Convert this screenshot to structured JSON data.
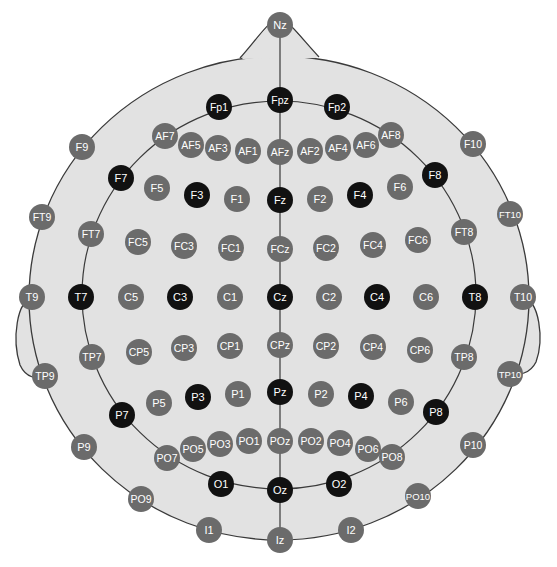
{
  "colors": {
    "background": "#ffffff",
    "head_fill": "#e2e2e2",
    "outline": "#3a3a3a",
    "electrode_standard": "#6b6b6b",
    "electrode_highlight": "#111111",
    "label_text": "#ffffff"
  },
  "legend": {
    "highlight": "10-20 system electrodes (black)",
    "standard": "Additional 10-10 electrodes (gray)"
  },
  "electrodes": [
    {
      "label": "Nz",
      "x": 280,
      "y": 25,
      "type": "standard"
    },
    {
      "label": "Fpz",
      "x": 280,
      "y": 100,
      "type": "highlight"
    },
    {
      "label": "Fp1",
      "x": 219,
      "y": 107,
      "type": "highlight"
    },
    {
      "label": "Fp2",
      "x": 337,
      "y": 107,
      "type": "highlight"
    },
    {
      "label": "AF7",
      "x": 165,
      "y": 136,
      "type": "standard"
    },
    {
      "label": "AF5",
      "x": 191,
      "y": 145,
      "type": "standard"
    },
    {
      "label": "AF3",
      "x": 218,
      "y": 148,
      "type": "standard"
    },
    {
      "label": "AF1",
      "x": 248,
      "y": 151,
      "type": "standard"
    },
    {
      "label": "AFz",
      "x": 280,
      "y": 152,
      "type": "standard"
    },
    {
      "label": "AF2",
      "x": 310,
      "y": 151,
      "type": "standard"
    },
    {
      "label": "AF4",
      "x": 338,
      "y": 148,
      "type": "standard"
    },
    {
      "label": "AF6",
      "x": 366,
      "y": 145,
      "type": "standard"
    },
    {
      "label": "AF8",
      "x": 391,
      "y": 135,
      "type": "standard"
    },
    {
      "label": "F9",
      "x": 82,
      "y": 147,
      "type": "standard"
    },
    {
      "label": "F10",
      "x": 473,
      "y": 144,
      "type": "standard"
    },
    {
      "label": "F7",
      "x": 121,
      "y": 178,
      "type": "highlight"
    },
    {
      "label": "F8",
      "x": 435,
      "y": 175,
      "type": "highlight"
    },
    {
      "label": "F5",
      "x": 157,
      "y": 188,
      "type": "standard"
    },
    {
      "label": "F3",
      "x": 197,
      "y": 195,
      "type": "highlight"
    },
    {
      "label": "F1",
      "x": 237,
      "y": 199,
      "type": "standard"
    },
    {
      "label": "Fz",
      "x": 280,
      "y": 200,
      "type": "highlight"
    },
    {
      "label": "F2",
      "x": 320,
      "y": 199,
      "type": "standard"
    },
    {
      "label": "F4",
      "x": 360,
      "y": 195,
      "type": "highlight"
    },
    {
      "label": "F6",
      "x": 400,
      "y": 187,
      "type": "standard"
    },
    {
      "label": "FT9",
      "x": 42,
      "y": 217,
      "type": "standard"
    },
    {
      "label": "FT10",
      "x": 510,
      "y": 214,
      "type": "standard"
    },
    {
      "label": "FT7",
      "x": 91,
      "y": 234,
      "type": "standard"
    },
    {
      "label": "FT8",
      "x": 464,
      "y": 232,
      "type": "standard"
    },
    {
      "label": "FC5",
      "x": 138,
      "y": 242,
      "type": "standard"
    },
    {
      "label": "FC3",
      "x": 184,
      "y": 246,
      "type": "standard"
    },
    {
      "label": "FC1",
      "x": 231,
      "y": 248,
      "type": "standard"
    },
    {
      "label": "FCz",
      "x": 280,
      "y": 249,
      "type": "standard"
    },
    {
      "label": "FC2",
      "x": 326,
      "y": 248,
      "type": "standard"
    },
    {
      "label": "FC4",
      "x": 373,
      "y": 245,
      "type": "standard"
    },
    {
      "label": "FC6",
      "x": 418,
      "y": 240,
      "type": "standard"
    },
    {
      "label": "T9",
      "x": 32,
      "y": 297,
      "type": "standard"
    },
    {
      "label": "T7",
      "x": 81,
      "y": 297,
      "type": "highlight"
    },
    {
      "label": "C5",
      "x": 131,
      "y": 297,
      "type": "standard"
    },
    {
      "label": "C3",
      "x": 180,
      "y": 297,
      "type": "highlight"
    },
    {
      "label": "C1",
      "x": 230,
      "y": 297,
      "type": "standard"
    },
    {
      "label": "Cz",
      "x": 280,
      "y": 297,
      "type": "highlight"
    },
    {
      "label": "C2",
      "x": 329,
      "y": 297,
      "type": "standard"
    },
    {
      "label": "C4",
      "x": 377,
      "y": 297,
      "type": "highlight"
    },
    {
      "label": "C6",
      "x": 426,
      "y": 297,
      "type": "standard"
    },
    {
      "label": "T8",
      "x": 475,
      "y": 297,
      "type": "highlight"
    },
    {
      "label": "T10",
      "x": 523,
      "y": 297,
      "type": "standard"
    },
    {
      "label": "TP9",
      "x": 45,
      "y": 376,
      "type": "standard"
    },
    {
      "label": "TP7",
      "x": 92,
      "y": 357,
      "type": "standard"
    },
    {
      "label": "CP5",
      "x": 139,
      "y": 352,
      "type": "standard"
    },
    {
      "label": "CP3",
      "x": 184,
      "y": 348,
      "type": "standard"
    },
    {
      "label": "CP1",
      "x": 230,
      "y": 346,
      "type": "standard"
    },
    {
      "label": "CPz",
      "x": 280,
      "y": 345,
      "type": "standard"
    },
    {
      "label": "CP2",
      "x": 326,
      "y": 346,
      "type": "standard"
    },
    {
      "label": "CP4",
      "x": 373,
      "y": 347,
      "type": "standard"
    },
    {
      "label": "CP6",
      "x": 420,
      "y": 350,
      "type": "standard"
    },
    {
      "label": "TP8",
      "x": 464,
      "y": 357,
      "type": "standard"
    },
    {
      "label": "TP10",
      "x": 510,
      "y": 374,
      "type": "standard"
    },
    {
      "label": "P9",
      "x": 84,
      "y": 447,
      "type": "standard"
    },
    {
      "label": "P10",
      "x": 473,
      "y": 445,
      "type": "standard"
    },
    {
      "label": "P7",
      "x": 122,
      "y": 415,
      "type": "highlight"
    },
    {
      "label": "P8",
      "x": 436,
      "y": 412,
      "type": "highlight"
    },
    {
      "label": "P5",
      "x": 159,
      "y": 403,
      "type": "standard"
    },
    {
      "label": "P3",
      "x": 198,
      "y": 397,
      "type": "highlight"
    },
    {
      "label": "P1",
      "x": 238,
      "y": 394,
      "type": "standard"
    },
    {
      "label": "Pz",
      "x": 280,
      "y": 392,
      "type": "highlight"
    },
    {
      "label": "P2",
      "x": 321,
      "y": 394,
      "type": "standard"
    },
    {
      "label": "P4",
      "x": 361,
      "y": 396,
      "type": "highlight"
    },
    {
      "label": "P6",
      "x": 401,
      "y": 402,
      "type": "standard"
    },
    {
      "label": "PO7",
      "x": 167,
      "y": 458,
      "type": "standard"
    },
    {
      "label": "PO5",
      "x": 193,
      "y": 449,
      "type": "standard"
    },
    {
      "label": "PO3",
      "x": 220,
      "y": 444,
      "type": "standard"
    },
    {
      "label": "PO1",
      "x": 249,
      "y": 441,
      "type": "standard"
    },
    {
      "label": "POz",
      "x": 280,
      "y": 441,
      "type": "standard"
    },
    {
      "label": "PO2",
      "x": 311,
      "y": 441,
      "type": "standard"
    },
    {
      "label": "PO4",
      "x": 340,
      "y": 443,
      "type": "standard"
    },
    {
      "label": "PO6",
      "x": 368,
      "y": 449,
      "type": "standard"
    },
    {
      "label": "PO8",
      "x": 392,
      "y": 457,
      "type": "standard"
    },
    {
      "label": "O1",
      "x": 221,
      "y": 484,
      "type": "highlight"
    },
    {
      "label": "Oz",
      "x": 280,
      "y": 490,
      "type": "highlight"
    },
    {
      "label": "O2",
      "x": 339,
      "y": 484,
      "type": "highlight"
    },
    {
      "label": "PO9",
      "x": 141,
      "y": 499,
      "type": "standard"
    },
    {
      "label": "PO10",
      "x": 418,
      "y": 496,
      "type": "standard"
    },
    {
      "label": "I1",
      "x": 209,
      "y": 530,
      "type": "standard"
    },
    {
      "label": "Iz",
      "x": 280,
      "y": 540,
      "type": "standard"
    },
    {
      "label": "I2",
      "x": 351,
      "y": 530,
      "type": "standard"
    }
  ]
}
